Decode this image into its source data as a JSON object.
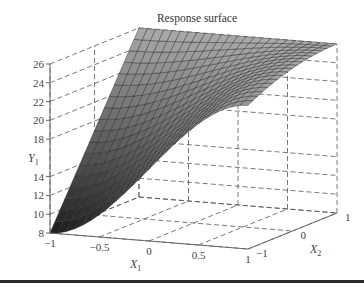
{
  "chart_data": {
    "type": "surface3d",
    "title": "Response surface",
    "xlabel": "X1",
    "x2label": "X2",
    "ylabel": "Y1",
    "x1_ticks": [
      "-1",
      "-0.5",
      "0",
      "0.5",
      "1"
    ],
    "x2_ticks": [
      "-1",
      "0",
      "1"
    ],
    "y_ticks": [
      "8",
      "10",
      "12",
      "14",
      "18",
      "20",
      "22",
      "24",
      "26"
    ],
    "x1_range": [
      -1,
      1
    ],
    "x2_range": [
      -1,
      1
    ],
    "y_range": [
      8,
      26
    ],
    "grid": true,
    "surface_description": "Y1 rises from 8 at (X1=-1, X2=-1) to 26 along X2=1; surface saturates at 26 toward X1=1, X2=1",
    "corner_values": [
      {
        "x1": -1,
        "x2": -1,
        "y": 8
      },
      {
        "x1": -1,
        "x2": 1,
        "y": 26
      },
      {
        "x1": 1,
        "x2": 1,
        "y": 26
      },
      {
        "x1": 1,
        "x2": -1,
        "y": 8
      }
    ]
  },
  "labels": {
    "title": "Response surface",
    "x1": "X",
    "x1_sub": "1",
    "x2": "X",
    "x2_sub": "2",
    "y": "Y",
    "y_sub": "1"
  }
}
